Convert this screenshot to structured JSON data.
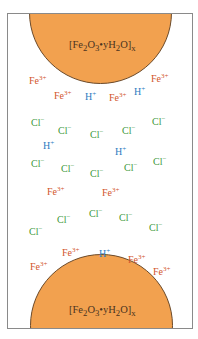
{
  "diagram": {
    "colors": {
      "rust": "#f2a14f",
      "fe": "#d2542c",
      "h": "#2b7cc0",
      "cl": "#3f9a3c",
      "border": "#8a8a8a"
    },
    "particles": {
      "top": {
        "formula": {
          "base": "[Fe",
          "s1": "2",
          "mid": "O",
          "s2": "3",
          "dot": "•yH",
          "s3": "2",
          "end": "O]",
          "sx": "x"
        }
      },
      "bottom": {
        "formula": {
          "base": "[Fe",
          "s1": "2",
          "mid": "O",
          "s2": "3",
          "dot": "•yH",
          "s3": "2",
          "end": "O]",
          "sx": "x"
        }
      }
    },
    "ions": [
      {
        "sym": "Fe",
        "ch": "3+",
        "type": "fe",
        "x": 28,
        "y": 74
      },
      {
        "sym": "Fe",
        "ch": "3+",
        "type": "fe",
        "x": 150,
        "y": 72
      },
      {
        "sym": "Fe",
        "ch": "3+",
        "type": "fe",
        "x": 53,
        "y": 89
      },
      {
        "sym": "H",
        "ch": "+",
        "type": "h",
        "x": 84,
        "y": 90
      },
      {
        "sym": "Fe",
        "ch": "3+",
        "type": "fe",
        "x": 108,
        "y": 91
      },
      {
        "sym": "H",
        "ch": "+",
        "type": "h",
        "x": 133,
        "y": 85
      },
      {
        "sym": "Cl",
        "ch": "−",
        "type": "cl",
        "x": 30,
        "y": 116
      },
      {
        "sym": "Cl",
        "ch": "−",
        "type": "cl",
        "x": 57,
        "y": 124
      },
      {
        "sym": "Cl",
        "ch": "−",
        "type": "cl",
        "x": 89,
        "y": 128
      },
      {
        "sym": "Cl",
        "ch": "−",
        "type": "cl",
        "x": 121,
        "y": 124
      },
      {
        "sym": "Cl",
        "ch": "−",
        "type": "cl",
        "x": 151,
        "y": 115
      },
      {
        "sym": "H",
        "ch": "+",
        "type": "h",
        "x": 42,
        "y": 139
      },
      {
        "sym": "H",
        "ch": "+",
        "type": "h",
        "x": 114,
        "y": 145
      },
      {
        "sym": "Cl",
        "ch": "−",
        "type": "cl",
        "x": 30,
        "y": 157
      },
      {
        "sym": "Cl",
        "ch": "−",
        "type": "cl",
        "x": 60,
        "y": 162
      },
      {
        "sym": "Cl",
        "ch": "−",
        "type": "cl",
        "x": 89,
        "y": 167
      },
      {
        "sym": "Cl",
        "ch": "−",
        "type": "cl",
        "x": 123,
        "y": 161
      },
      {
        "sym": "Cl",
        "ch": "−",
        "type": "cl",
        "x": 152,
        "y": 155
      },
      {
        "sym": "Fe",
        "ch": "3+",
        "type": "fe",
        "x": 46,
        "y": 185
      },
      {
        "sym": "Fe",
        "ch": "3+",
        "type": "fe",
        "x": 101,
        "y": 186
      },
      {
        "sym": "Cl",
        "ch": "−",
        "type": "cl",
        "x": 56,
        "y": 213
      },
      {
        "sym": "Cl",
        "ch": "−",
        "type": "cl",
        "x": 88,
        "y": 207
      },
      {
        "sym": "Cl",
        "ch": "−",
        "type": "cl",
        "x": 118,
        "y": 211
      },
      {
        "sym": "Cl",
        "ch": "−",
        "type": "cl",
        "x": 28,
        "y": 225
      },
      {
        "sym": "Cl",
        "ch": "−",
        "type": "cl",
        "x": 148,
        "y": 221
      },
      {
        "sym": "Fe",
        "ch": "3+",
        "type": "fe",
        "x": 61,
        "y": 246
      },
      {
        "sym": "H",
        "ch": "+",
        "type": "h",
        "x": 98,
        "y": 247
      },
      {
        "sym": "Fe",
        "ch": "3+",
        "type": "fe",
        "x": 127,
        "y": 253
      },
      {
        "sym": "Fe",
        "ch": "3+",
        "type": "fe",
        "x": 29,
        "y": 260
      },
      {
        "sym": "Fe",
        "ch": "3+",
        "type": "fe",
        "x": 152,
        "y": 265
      }
    ]
  }
}
